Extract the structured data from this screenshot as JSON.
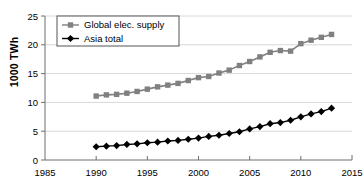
{
  "chart_data": {
    "type": "line",
    "title": "",
    "xlabel": "",
    "ylabel": "1000 TWh",
    "xlim": [
      1985,
      2015
    ],
    "ylim": [
      0,
      25
    ],
    "xticks": [
      1985,
      1990,
      1995,
      2000,
      2005,
      2010,
      2015
    ],
    "yticks": [
      0,
      5,
      10,
      15,
      20,
      25
    ],
    "grid": "horizontal",
    "legend_position": "top-left",
    "x": [
      1990,
      1991,
      1992,
      1993,
      1994,
      1995,
      1996,
      1997,
      1998,
      1999,
      2000,
      2001,
      2002,
      2003,
      2004,
      2005,
      2006,
      2007,
      2008,
      2009,
      2010,
      2011,
      2012,
      2013
    ],
    "series": [
      {
        "name": "Global elec. supply",
        "color": "#808080",
        "marker": "square",
        "values": [
          11.1,
          11.3,
          11.4,
          11.6,
          11.9,
          12.3,
          12.7,
          13.0,
          13.3,
          13.8,
          14.3,
          14.5,
          15.1,
          15.6,
          16.4,
          17.1,
          17.9,
          18.7,
          19.0,
          18.9,
          20.2,
          20.8,
          21.3,
          21.8
        ]
      },
      {
        "name": "Asia total",
        "color": "#000000",
        "marker": "diamond",
        "values": [
          2.3,
          2.4,
          2.5,
          2.7,
          2.8,
          3.0,
          3.1,
          3.3,
          3.4,
          3.6,
          3.8,
          4.1,
          4.3,
          4.6,
          4.9,
          5.4,
          5.8,
          6.3,
          6.5,
          6.9,
          7.5,
          8.0,
          8.4,
          9.0
        ]
      }
    ],
    "legend_entries": [
      {
        "label": "Global elec. supply",
        "color": "#808080",
        "marker": "square"
      },
      {
        "label": "Asia total",
        "color": "#000000",
        "marker": "diamond"
      }
    ],
    "tick_labels": {
      "x": [
        "1985",
        "1990",
        "1995",
        "2000",
        "2005",
        "2010",
        "2015"
      ],
      "y": [
        "0",
        "5",
        "10",
        "15",
        "20",
        "25"
      ]
    }
  }
}
